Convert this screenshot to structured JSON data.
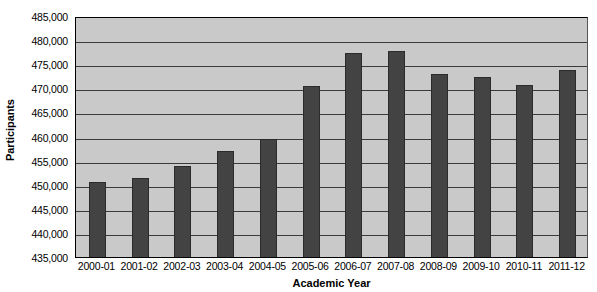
{
  "chart_data": {
    "type": "bar",
    "title": "",
    "xlabel": "Academic Year",
    "ylabel": "Participants",
    "categories": [
      "2000-01",
      "2001-02",
      "2002-03",
      "2003-04",
      "2004-05",
      "2005-06",
      "2006-07",
      "2007-08",
      "2008-09",
      "2009-10",
      "2010-11",
      "2011-12"
    ],
    "values": [
      450500,
      451500,
      453800,
      457000,
      459500,
      470500,
      477300,
      477700,
      473000,
      472300,
      470600,
      473800
    ],
    "ylim": [
      435000,
      485000
    ],
    "ytick_values": [
      435000,
      440000,
      445000,
      450000,
      455000,
      460000,
      465000,
      470000,
      475000,
      480000,
      485000
    ],
    "ytick_labels": [
      "435,000",
      "440,000",
      "445,000",
      "450,000",
      "455,000",
      "460,000",
      "465,000",
      "470,000",
      "475,000",
      "480,000",
      "485,000"
    ],
    "grid": true,
    "grid_axis": "y",
    "legend": false,
    "legend_position": "none",
    "bar_color": "#434343",
    "plot_background_color": "#c9c9c9",
    "figure_background_color": "#ffffff",
    "gridline_color": "#3a3a3a",
    "axis_color": "#000000"
  }
}
